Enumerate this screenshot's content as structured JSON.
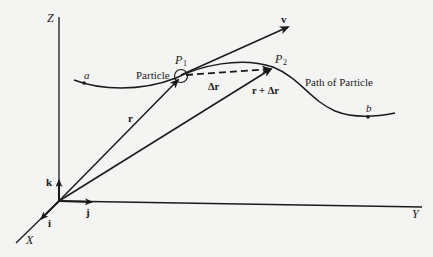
{
  "diagram": {
    "axes": {
      "z_label": "Z",
      "y_label": "Y",
      "x_label": "X"
    },
    "unit_vectors": {
      "k": "k",
      "j": "j",
      "i": "i"
    },
    "points": {
      "p1_label": "P",
      "p1_sub": "1",
      "p2_label": "P",
      "p2_sub": "2",
      "a_label": "a",
      "b_label": "b"
    },
    "vectors": {
      "r_label": "r",
      "r_plus_dr_label": "r + Δr",
      "dr_label": "Δr",
      "v_label": "v"
    },
    "annotations": {
      "particle": "Particle",
      "path": "Path of Particle"
    },
    "colors": {
      "ink": "#1a1a1a",
      "paper": "#f4f4f2"
    }
  }
}
